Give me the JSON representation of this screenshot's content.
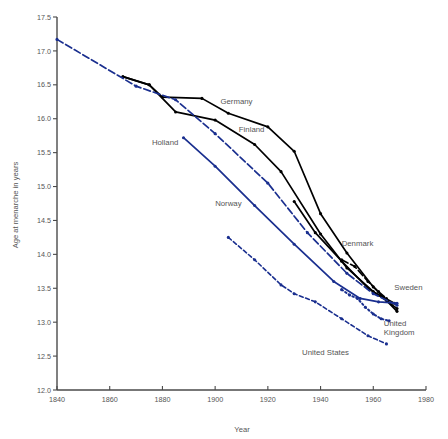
{
  "chart_data": {
    "type": "line",
    "title": "",
    "xlabel": "Year",
    "ylabel": "Age at menarche in years",
    "xlim": [
      1840,
      1980
    ],
    "ylim": [
      12.0,
      17.5
    ],
    "grid": false,
    "legend_position": "inline-labels",
    "xticks": [
      1840,
      1860,
      1880,
      1900,
      1920,
      1940,
      1960,
      1980
    ],
    "xtick_labels": [
      "1840",
      "1860",
      "1880",
      "1900",
      "1920",
      "1940",
      "1960",
      "1980"
    ],
    "yticks": [
      12.0,
      12.5,
      13.0,
      13.5,
      14.0,
      14.5,
      15.0,
      15.5,
      16.0,
      16.5,
      17.0,
      17.5
    ],
    "ytick_labels": [
      "12.0",
      "12.5",
      "13.0",
      "13.5",
      "14.0",
      "14.5",
      "15.0",
      "15.5",
      "16.0",
      "16.5",
      "17.0",
      "17.5"
    ],
    "series": [
      {
        "name": "Germany",
        "color": "#000000",
        "style": "solid",
        "markers": true,
        "label": "Germany",
        "label_x": 1902,
        "label_y": 16.22,
        "x": [
          1865,
          1875,
          1880,
          1895,
          1905,
          1920,
          1930,
          1940,
          1950,
          1960,
          1969
        ],
        "y": [
          16.62,
          16.5,
          16.32,
          16.3,
          16.08,
          15.88,
          15.52,
          14.6,
          14.02,
          13.52,
          13.16
        ]
      },
      {
        "name": "Finland",
        "color": "#000000",
        "style": "solid",
        "markers": true,
        "label": "Finland",
        "label_x": 1909,
        "label_y": 15.8,
        "x": [
          1865,
          1875,
          1885,
          1900,
          1915,
          1925,
          1940,
          1950,
          1960,
          1968
        ],
        "y": [
          16.62,
          16.5,
          16.1,
          15.98,
          15.62,
          15.22,
          14.3,
          13.8,
          13.45,
          13.28
        ]
      },
      {
        "name": "Denmark",
        "color": "#000000",
        "style": "dashed",
        "markers": true,
        "label": "Denmark",
        "label_x": 1948,
        "label_y": 14.12,
        "x": [
          1948,
          1953,
          1958,
          1962,
          1965
        ],
        "y": [
          13.92,
          13.82,
          13.6,
          13.45,
          13.35
        ]
      },
      {
        "name": "Sweden",
        "color": "#000000",
        "style": "solid",
        "markers": true,
        "label": "Sweden",
        "label_x": 1968,
        "label_y": 13.48,
        "x": [
          1930,
          1938,
          1948,
          1958,
          1965,
          1969
        ],
        "y": [
          14.78,
          14.32,
          13.9,
          13.5,
          13.32,
          13.2
        ]
      },
      {
        "name": "Holland",
        "color": "#1a2f8f",
        "style": "dashed",
        "markers": true,
        "label": "Holland",
        "label_x": 1876,
        "label_y": 15.62,
        "x": [
          1840,
          1870,
          1885,
          1900,
          1920,
          1935,
          1950,
          1960,
          1969
        ],
        "y": [
          17.17,
          16.48,
          16.28,
          15.78,
          15.05,
          14.32,
          13.72,
          13.42,
          13.25
        ]
      },
      {
        "name": "Norway",
        "color": "#1a2f8f",
        "style": "solid",
        "markers": true,
        "label": "Norway",
        "label_x": 1900,
        "label_y": 14.72,
        "x": [
          1888,
          1900,
          1915,
          1930,
          1945,
          1955,
          1962,
          1969
        ],
        "y": [
          15.72,
          15.3,
          14.72,
          14.15,
          13.6,
          13.35,
          13.3,
          13.28
        ]
      },
      {
        "name": "United Kingdom",
        "color": "#1a2f8f",
        "style": "dotted",
        "markers": true,
        "label": "United\nKingdom",
        "label_x": 1964,
        "label_y": 12.95,
        "x": [
          1948,
          1951,
          1954,
          1957,
          1960,
          1963,
          1966
        ],
        "y": [
          13.48,
          13.4,
          13.35,
          13.22,
          13.12,
          13.05,
          13.02
        ]
      },
      {
        "name": "United States",
        "color": "#1a2f8f",
        "style": "dashed-fine",
        "markers": true,
        "label": "United States",
        "label_x": 1933,
        "label_y": 12.52,
        "x": [
          1905,
          1915,
          1925,
          1930,
          1938,
          1948,
          1958,
          1965
        ],
        "y": [
          14.25,
          13.92,
          13.55,
          13.42,
          13.3,
          13.05,
          12.8,
          12.68
        ]
      }
    ]
  },
  "labels": {
    "germany": "Germany",
    "finland": "Finland",
    "holland": "Holland",
    "norway": "Norway",
    "denmark": "Denmark",
    "sweden": "Sweden",
    "united_kingdom_line1": "United",
    "united_kingdom_line2": "Kingdom",
    "united_states": "United States"
  },
  "axes": {
    "x_title": "Year",
    "y_title": "Age at menarche in years"
  },
  "colors": {
    "black_series": "#000000",
    "blue_series": "#1a2f8f",
    "axis": "#4a4a4a",
    "text": "#555555",
    "background": "#ffffff"
  }
}
